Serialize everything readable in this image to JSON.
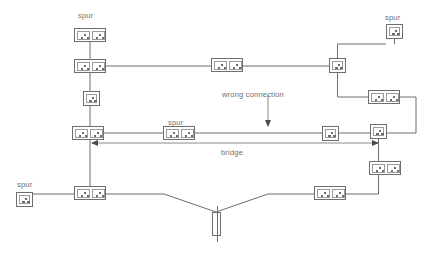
{
  "diagram": {
    "background_color": "#ffffff",
    "line_color": "#6e6e6e",
    "text_color": "#6f6f6f"
  },
  "labels": [
    {
      "id": "spur-top-left",
      "text": "spur",
      "x": 78,
      "y": 11
    },
    {
      "id": "spur-top-right",
      "text": "spur",
      "x": 385,
      "y": 13
    },
    {
      "id": "spur-middle",
      "text": "spur",
      "x": 168,
      "y": 118
    },
    {
      "id": "spur-bottom-left",
      "text": "spur",
      "x": 17,
      "y": 180
    },
    {
      "id": "wrong-connection",
      "text": "wrong connection",
      "x": 222,
      "y": 90
    },
    {
      "id": "bridge",
      "text": "bridge",
      "x": 221,
      "y": 148
    }
  ],
  "sockets": [
    {
      "id": "socket-spur-top-left",
      "type": "double",
      "x": 74,
      "y": 28,
      "w": 32,
      "h": 14
    },
    {
      "id": "socket-upper-left-tee",
      "type": "double",
      "x": 74,
      "y": 59,
      "w": 32,
      "h": 14
    },
    {
      "id": "socket-upper-mid",
      "type": "double",
      "x": 211,
      "y": 58,
      "w": 32,
      "h": 14
    },
    {
      "id": "socket-left-single",
      "type": "single",
      "x": 83,
      "y": 91,
      "w": 17,
      "h": 15
    },
    {
      "id": "socket-left-ring-corner",
      "type": "double",
      "x": 72,
      "y": 126,
      "w": 32,
      "h": 14
    },
    {
      "id": "socket-spur-middle",
      "type": "double",
      "x": 163,
      "y": 126,
      "w": 32,
      "h": 14
    },
    {
      "id": "socket-mid-right-single",
      "type": "single",
      "x": 322,
      "y": 126,
      "w": 17,
      "h": 15
    },
    {
      "id": "socket-right-ring-corner",
      "type": "single",
      "x": 370,
      "y": 124,
      "w": 17,
      "h": 15
    },
    {
      "id": "socket-top-right-single",
      "type": "single",
      "x": 386,
      "y": 24,
      "w": 17,
      "h": 15
    },
    {
      "id": "socket-upper-right-tee",
      "type": "single",
      "x": 329,
      "y": 58,
      "w": 17,
      "h": 15
    },
    {
      "id": "socket-right-double",
      "type": "double",
      "x": 368,
      "y": 90,
      "w": 32,
      "h": 14
    },
    {
      "id": "socket-right-lower",
      "type": "double",
      "x": 369,
      "y": 161,
      "w": 32,
      "h": 14
    },
    {
      "id": "socket-bottom-right",
      "type": "double",
      "x": 314,
      "y": 186,
      "w": 32,
      "h": 14
    },
    {
      "id": "socket-spur-bottom-left",
      "type": "single",
      "x": 16,
      "y": 192,
      "w": 17,
      "h": 15
    },
    {
      "id": "socket-bottom-left-tee",
      "type": "double",
      "x": 74,
      "y": 186,
      "w": 32,
      "h": 14
    }
  ],
  "supply": {
    "id": "consumer-unit-fuse",
    "type": "fuse",
    "x": 212,
    "y": 212,
    "w": 9,
    "h": 24
  },
  "wires": {
    "paths": [
      "M90,42 L90,59",
      "M90,73 L90,91",
      "M90,106 L90,126",
      "M106,66 L211,66",
      "M243,66 L329,66",
      "M337.5,58 L337.5,44 L386,44",
      "M337.5,73 L337.5,97 L368,97",
      "M400,97 L416,97 L416,133",
      "M387,133 L416,133",
      "M378.5,139 L378.5,161",
      "M378.5,175 L378.5,194 L346,194",
      "M314,194 L268,194 L216,212",
      "M216,212 L164,194 L106,194",
      "M74,194 L33,194",
      "M90,140 L90,186",
      "M104,133 L163,133",
      "M195,133 L322,133",
      "M339,133 L370,133",
      "M394.5,24 L394.5,44"
    ],
    "wrong_connection_arrow": {
      "from": [
        268,
        95
      ],
      "to": [
        268,
        126
      ]
    },
    "bridge_arrow": {
      "from": [
        92,
        143
      ],
      "to": [
        378,
        143
      ]
    }
  }
}
